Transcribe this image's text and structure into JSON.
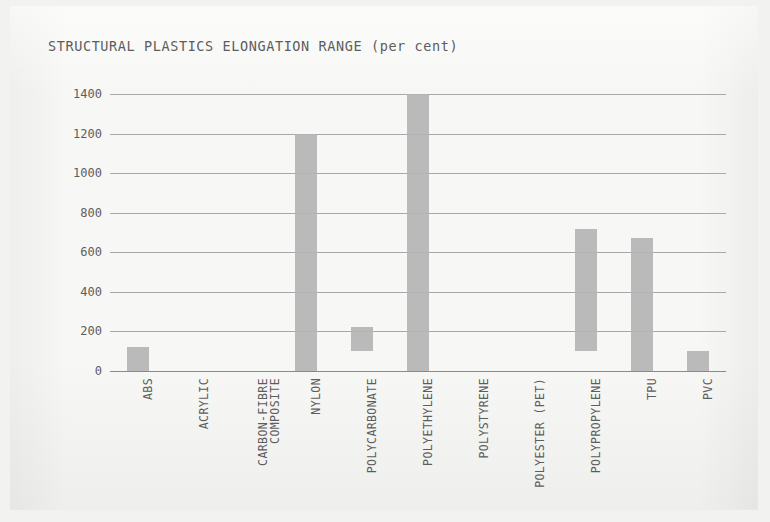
{
  "title": "STRUCTURAL PLASTICS ELONGATION RANGE (per cent)",
  "colors": {
    "bar": "#b4b4b4",
    "grid": "#9a9a9a",
    "text": "#5d5d5d",
    "paper": "#f7f7f5",
    "background": "#f2f2f0"
  },
  "chart_data": {
    "type": "bar",
    "title": "STRUCTURAL PLASTICS ELONGATION RANGE (per cent)",
    "subtitle": "",
    "xlabel": "",
    "ylabel": "",
    "orientation": "vertical",
    "bar_style": "floating-range",
    "grid": true,
    "legend": false,
    "ylim": [
      0,
      1400
    ],
    "yticks": [
      0,
      200,
      400,
      600,
      800,
      1000,
      1200,
      1400
    ],
    "ytick_labels": [
      "0",
      "200",
      "400",
      "600",
      "800",
      "1000",
      "1200",
      "1400"
    ],
    "categories": [
      "ABS",
      "ACRYLIC",
      "CARBON-FIBRE\nCOMPOSITE",
      "NYLON",
      "POLYCARBONATE",
      "POLYETHYLENE",
      "POLYSTYRENE",
      "POLYESTER (PET)",
      "POLYPROPYLENE",
      "TPU",
      "PVC"
    ],
    "series": [
      {
        "name": "Elongation range (per cent)",
        "low": [
          0,
          0,
          0,
          0,
          100,
          0,
          0,
          0,
          100,
          0,
          0
        ],
        "high": [
          120,
          0,
          0,
          1200,
          220,
          1400,
          0,
          0,
          720,
          670,
          100
        ]
      }
    ],
    "bars": [
      {
        "category": "ABS",
        "low": 0,
        "high": 120
      },
      {
        "category": "ACRYLIC",
        "low": 0,
        "high": 0
      },
      {
        "category": "CARBON-FIBRE COMPOSITE",
        "low": 0,
        "high": 0
      },
      {
        "category": "NYLON",
        "low": 0,
        "high": 1200
      },
      {
        "category": "POLYCARBONATE",
        "low": 100,
        "high": 220
      },
      {
        "category": "POLYETHYLENE",
        "low": 0,
        "high": 1400
      },
      {
        "category": "POLYSTYRENE",
        "low": 0,
        "high": 0
      },
      {
        "category": "POLYESTER (PET)",
        "low": 0,
        "high": 0
      },
      {
        "category": "POLYPROPYLENE",
        "low": 100,
        "high": 720
      },
      {
        "category": "TPU",
        "low": 0,
        "high": 670
      },
      {
        "category": "PVC",
        "low": 0,
        "high": 100
      }
    ]
  }
}
